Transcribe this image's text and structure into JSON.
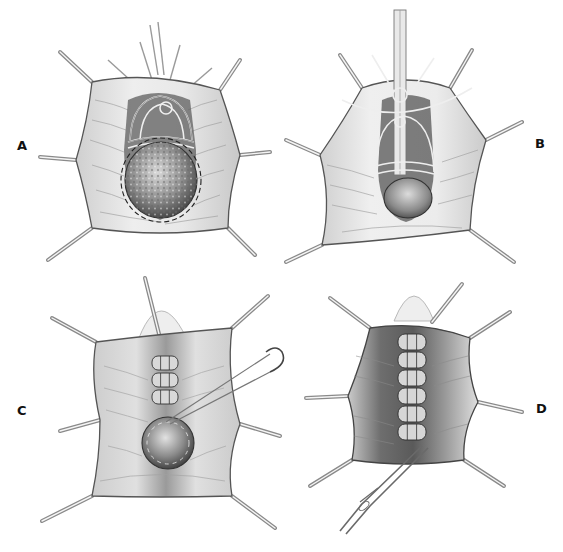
{
  "figure": {
    "type": "surgical-illustration",
    "style": "grayscale pencil/ink drawing",
    "colors": {
      "background": "#ffffff",
      "tissue_light": "#e6e6e6",
      "tissue_mid": "#b8b8b8",
      "tissue_dark": "#5a5a5a",
      "outline": "#3a3a3a",
      "label": "#111111"
    },
    "panels": [
      {
        "id": "A",
        "label": "A",
        "position": "top-left",
        "depicts": "Retracted operative field with purse-string sutures placed around the neck; large rounded mass (sac) at bottom with dashed incision line",
        "retractors": 8
      },
      {
        "id": "B",
        "label": "B",
        "position": "top-right",
        "depicts": "Catheter/tube in midline with sutures looped and tied; mass reduced, tissue tented around",
        "retractors": 8
      },
      {
        "id": "C",
        "label": "C",
        "position": "bottom-left",
        "depicts": "Imbricating interrupted sutures placed in rows above the remaining mass; curved needle with suture entering tissue",
        "retractors": 8
      },
      {
        "id": "D",
        "label": "D",
        "position": "bottom-right",
        "depicts": "Completed column of imbricated sutures; needle holder / forceps at bottom",
        "retractors": 7
      }
    ]
  }
}
